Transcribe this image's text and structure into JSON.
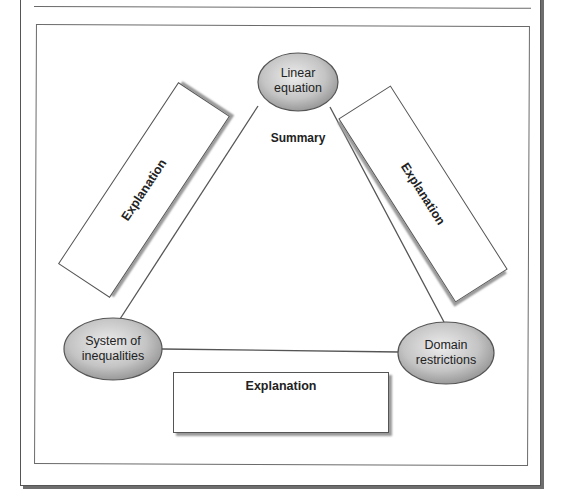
{
  "diagram": {
    "nodes": {
      "top": {
        "line1": "Linear",
        "line2": "equation"
      },
      "left": {
        "line1": "System of",
        "line2": "inequalities"
      },
      "right": {
        "line1": "Domain",
        "line2": "restrictions"
      }
    },
    "center_label": "Summary",
    "explanations": {
      "left": "Explanation",
      "right": "Explanation",
      "bottom": "Explanation"
    },
    "colors": {
      "node_fill_light": "#e6e6e6",
      "node_fill_dark": "#9c9c9c",
      "line": "#555555",
      "text": "#222222"
    }
  }
}
